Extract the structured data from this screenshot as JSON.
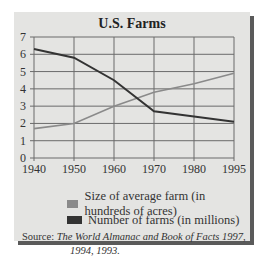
{
  "chart_data": {
    "type": "line",
    "title": "U.S. Farms",
    "xlabel": "",
    "ylabel": "",
    "categories": [
      "1940",
      "1950",
      "1960",
      "1970",
      "1980",
      "1995"
    ],
    "ylim": [
      0,
      7
    ],
    "yticks": [
      "0",
      "1",
      "2",
      "3",
      "4",
      "5",
      "6",
      "7"
    ],
    "grid": true,
    "legend_position": "bottom",
    "series": [
      {
        "name": "Size of average farm (in hundreds of acres)",
        "color": "#8a8a8a",
        "values": [
          1.7,
          2.0,
          3.0,
          3.8,
          4.3,
          4.9
        ]
      },
      {
        "name": "Number of farms (in millions)",
        "color": "#333333",
        "values": [
          6.3,
          5.8,
          4.5,
          2.7,
          2.4,
          2.1
        ]
      }
    ]
  },
  "legend": {
    "items": [
      {
        "label": "Size of average farm (in hundreds of acres)",
        "color": "#8a8a8a"
      },
      {
        "label": "Number of farms (in millions)",
        "color": "#333333"
      }
    ]
  },
  "source": {
    "prefix": "Source: ",
    "text_line1": "The World Almanac and Book of Facts 1997,",
    "text_line2": "1994, 1993."
  }
}
